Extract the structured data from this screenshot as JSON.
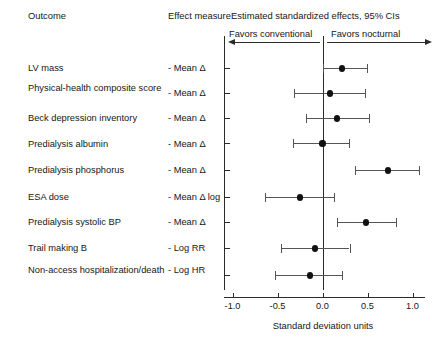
{
  "header": {
    "outcome_col": "Outcome",
    "effect_col": "Effect measure",
    "plot_title": "Estimated standardized effects, 95% CIs",
    "favors_left": "Favors conventional",
    "favors_right": "Favors nocturnal",
    "left_arrow_icon": "arrow-left-icon",
    "right_arrow_icon": "arrow-right-icon"
  },
  "axis": {
    "title": "Standard deviation units",
    "ticks": [
      "-1.0",
      "-0.5",
      "0.0",
      "0.5",
      "1.0"
    ],
    "tick_values": [
      -1.0,
      -0.5,
      0.0,
      0.5,
      1.0
    ],
    "reference_line": 0.0
  },
  "chart_data": {
    "type": "scatter",
    "title": "Estimated standardized effects, 95% CIs",
    "xlabel": "Standard deviation units",
    "ylabel": "Outcome",
    "xlim": [
      -1.15,
      1.15
    ],
    "grid": false,
    "legend": "none",
    "reference_line": 0.0,
    "annotations": [
      "Favors conventional",
      "Favors nocturnal"
    ],
    "columns": [
      "Outcome",
      "Effect measure",
      "Estimate",
      "CI low",
      "CI high"
    ],
    "rows": [
      {
        "outcome": "LV mass",
        "effect_measure": "- Mean Δ",
        "estimate": 0.22,
        "ci_low": 0.0,
        "ci_high": 0.49
      },
      {
        "outcome": "Physical-health composite score",
        "effect_measure": "- Mean Δ",
        "estimate": 0.08,
        "ci_low": -0.32,
        "ci_high": 0.47
      },
      {
        "outcome": "Beck depression inventory",
        "effect_measure": "- Mean Δ",
        "estimate": 0.16,
        "ci_low": -0.18,
        "ci_high": 0.52
      },
      {
        "outcome": "Predialysis albumin",
        "effect_measure": "- Mean Δ",
        "estimate": 0.0,
        "ci_low": -0.33,
        "ci_high": 0.29
      },
      {
        "outcome": "Predialysis phosphorus",
        "effect_measure": "- Mean Δ",
        "estimate": 0.73,
        "ci_low": 0.36,
        "ci_high": 1.07
      },
      {
        "outcome": "ESA dose",
        "effect_measure": "- Mean Δ log",
        "estimate": -0.25,
        "ci_low": -0.64,
        "ci_high": 0.13
      },
      {
        "outcome": "Predialysis systolic BP",
        "effect_measure": "- Mean Δ",
        "estimate": 0.48,
        "ci_low": 0.16,
        "ci_high": 0.82
      },
      {
        "outcome": "Trail making B",
        "effect_measure": "- Log RR",
        "estimate": -0.08,
        "ci_low": -0.46,
        "ci_high": 0.3
      },
      {
        "outcome": "Non-access hospitalization/death",
        "effect_measure": "- Log HR",
        "estimate": -0.14,
        "ci_low": -0.53,
        "ci_high": 0.22
      }
    ]
  }
}
